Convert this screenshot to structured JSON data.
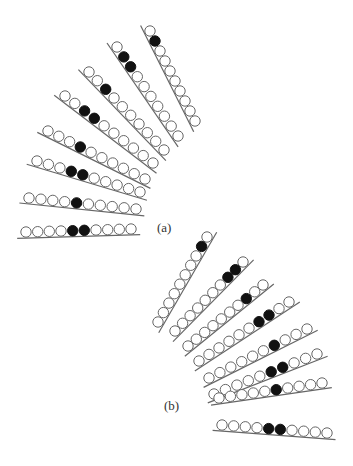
{
  "figure": {
    "colors": {
      "stroke": "#666666",
      "filled": "#111111",
      "open": "#ffffff"
    },
    "panels": [
      {
        "id": "a",
        "label": "(a)",
        "rows": [
          {
            "cells": [
              0,
              1,
              0,
              0,
              0,
              0,
              0,
              0,
              0,
              0
            ]
          },
          {
            "cells": [
              0,
              1,
              1,
              0,
              0,
              0,
              0,
              0,
              0,
              0
            ]
          },
          {
            "cells": [
              0,
              0,
              1,
              0,
              0,
              0,
              0,
              0,
              0,
              0
            ]
          },
          {
            "cells": [
              0,
              0,
              1,
              1,
              0,
              0,
              0,
              0,
              0,
              0
            ]
          },
          {
            "cells": [
              0,
              0,
              0,
              1,
              0,
              0,
              0,
              0,
              0,
              0
            ]
          },
          {
            "cells": [
              0,
              0,
              0,
              1,
              1,
              0,
              0,
              0,
              0,
              0
            ]
          },
          {
            "cells": [
              0,
              0,
              0,
              0,
              1,
              0,
              0,
              0,
              0,
              0
            ]
          },
          {
            "cells": [
              0,
              0,
              0,
              0,
              1,
              1,
              0,
              0,
              0,
              0
            ]
          }
        ]
      },
      {
        "id": "b",
        "label": "(b)",
        "rows": [
          {
            "cells": [
              0,
              1,
              0,
              0,
              0,
              0,
              0,
              0,
              0,
              0
            ]
          },
          {
            "cells": [
              0,
              1,
              1,
              0,
              0,
              0,
              0,
              0,
              0,
              0
            ]
          },
          {
            "cells": [
              0,
              0,
              1,
              0,
              0,
              0,
              0,
              0,
              0,
              0
            ]
          },
          {
            "cells": [
              0,
              0,
              1,
              1,
              0,
              0,
              0,
              0,
              0,
              0
            ]
          },
          {
            "cells": [
              0,
              0,
              0,
              1,
              0,
              0,
              0,
              0,
              0,
              0
            ]
          },
          {
            "cells": [
              0,
              0,
              0,
              1,
              1,
              0,
              0,
              0,
              0,
              0
            ]
          },
          {
            "cells": [
              0,
              0,
              0,
              0,
              1,
              0,
              0,
              0,
              0,
              0
            ]
          },
          {
            "cells": [
              0,
              0,
              0,
              0,
              1,
              1,
              0,
              0,
              0,
              0
            ]
          }
        ]
      }
    ]
  }
}
